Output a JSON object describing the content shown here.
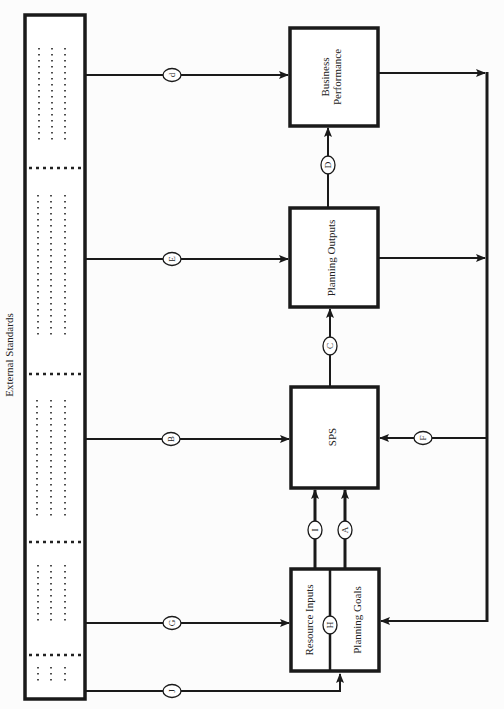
{
  "diagram": {
    "orientation": "rotated-90-ccw",
    "side_label": "External Standards",
    "nodes": {
      "business_performance": "Business Performance",
      "business_performance_line1": "Business",
      "business_performance_line2": "Performance",
      "planning_outputs": "Planning Outputs",
      "sps": "SPS",
      "resource_inputs": "Resource Inputs",
      "planning_goals": "Planning Goals"
    },
    "connectors": {
      "d": "d",
      "E": "E",
      "B": "B",
      "G": "G",
      "J": "J",
      "D": "D",
      "C": "C",
      "I": "I",
      "A": "A",
      "H": "H",
      "F": "F"
    },
    "edges": [
      {
        "from": "External Standards",
        "to": "Business Performance",
        "label": "d"
      },
      {
        "from": "External Standards",
        "to": "Planning Outputs",
        "label": "E"
      },
      {
        "from": "External Standards",
        "to": "SPS",
        "label": "B"
      },
      {
        "from": "External Standards",
        "to": "Resource Inputs",
        "label": "G"
      },
      {
        "from": "External Standards",
        "to": "Planning Goals",
        "label": "J"
      },
      {
        "from": "Planning Outputs",
        "to": "Business Performance",
        "label": "D"
      },
      {
        "from": "SPS",
        "to": "Planning Outputs",
        "label": "C"
      },
      {
        "from": "Resource Inputs",
        "to": "SPS",
        "label": "I"
      },
      {
        "from": "Planning Goals",
        "to": "SPS",
        "label": "A"
      },
      {
        "from": "Resource Inputs",
        "to": "Planning Goals",
        "label": "H"
      },
      {
        "from": "Feedback loop",
        "to": "SPS",
        "label": "F"
      },
      {
        "from": "Business Performance",
        "to": "Feedback loop",
        "label": ""
      },
      {
        "from": "Planning Outputs",
        "to": "Feedback loop",
        "label": ""
      },
      {
        "from": "Feedback loop",
        "to": "Planning Goals",
        "label": ""
      }
    ]
  }
}
